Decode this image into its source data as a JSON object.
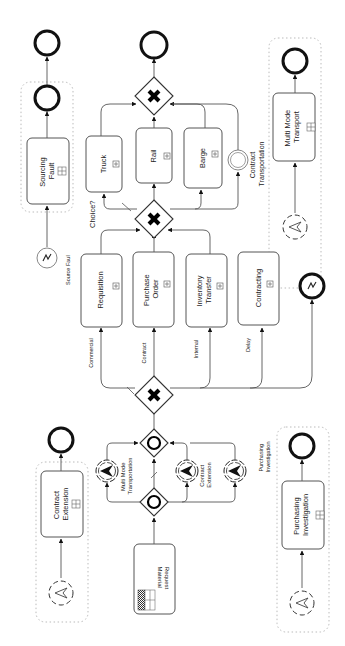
{
  "diagram": {
    "type": "BPMN process (rotated 90deg, flow bottom to top)",
    "start": {
      "task": "Material Request"
    },
    "gateways": {
      "split_inclusive": {
        "kind": "event-based/inclusive (circle)"
      },
      "join_inclusive": {
        "kind": "event-based/inclusive (circle)"
      },
      "source_choice": {
        "kind": "exclusive (X)"
      },
      "transport_choice": {
        "kind": "exclusive (X)",
        "label": "Choice?"
      },
      "final_join": {
        "kind": "exclusive (X)"
      }
    },
    "escalation_events": [
      {
        "label": "Multi Mode Transportation"
      },
      {
        "label": "Contract Extension"
      },
      {
        "label": ""
      }
    ],
    "source_flows": [
      {
        "condition": "Commercial",
        "task": "Requisition"
      },
      {
        "condition": "Contract",
        "task": "Purchase Order"
      },
      {
        "condition": "Internal",
        "task": "Inventory Transfer"
      },
      {
        "condition": "Delay",
        "task": "Contracting"
      }
    ],
    "error_end": {
      "kind": "error end event"
    },
    "transport_tasks": [
      {
        "task": "Truck"
      },
      {
        "task": "Rail"
      },
      {
        "task": "Barge"
      }
    ],
    "intermediate_event": {
      "label": "Contract Transportation"
    },
    "event_subprocesses": [
      {
        "id": "sourcing",
        "trigger": "error",
        "trigger_label": "Source Faul",
        "task": "Sourcing Fault"
      },
      {
        "id": "contract-ext",
        "trigger": "escalation",
        "trigger_label": "",
        "task": "Contract Extension"
      },
      {
        "id": "multimode",
        "trigger": "escalation",
        "trigger_label": "",
        "task": "Multi Mode Transport"
      },
      {
        "id": "purchasing",
        "trigger": "escalation",
        "trigger_label": "Purchasing Investigation",
        "task": "Purchasing Investigation"
      }
    ]
  },
  "labels": {
    "material_request_1": "Material",
    "material_request_2": "Request",
    "requisition": "Requisition",
    "purchase_order_1": "Purchase",
    "purchase_order_2": "Order",
    "inventory_transfer_1": "Inventory",
    "inventory_transfer_2": "Transfer",
    "contracting": "Contracting",
    "truck": "Truck",
    "rail": "Rail",
    "barge": "Barge",
    "choice": "Choice?",
    "commercial": "Commercial",
    "contract": "Contract",
    "internal": "Internal",
    "delay": "Delay",
    "contract_transportation_1": "Contract",
    "contract_transportation_2": "Transportation",
    "multi_mode_transportation_1": "Multi Mode",
    "multi_mode_transportation_2": "Transportation",
    "contract_extension_evt_1": "Contract",
    "contract_extension_evt_2": "Extension",
    "sourcing_fault_1": "Sourcing",
    "sourcing_fault_2": "Fault",
    "source_faul": "Source Faul",
    "contract_extension_1": "Contract",
    "contract_extension_2": "Extension",
    "multi_mode_transport_1": "Multi Mode",
    "multi_mode_transport_2": "Transport",
    "purchasing_investigation_1": "Purchasing",
    "purchasing_investigation_2": "Investigation",
    "purchasing_investigation_lbl_1": "Purchasing",
    "purchasing_investigation_lbl_2": "Investigation"
  }
}
